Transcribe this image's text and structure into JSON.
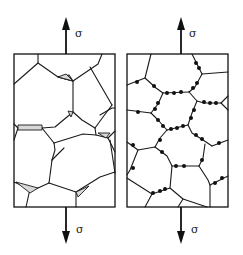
{
  "figure": {
    "panels": [
      {
        "id": "wedge-cracking",
        "stress_label_top": "σ",
        "stress_label_bottom": "σ",
        "feature": "triple-point wedge cracks"
      },
      {
        "id": "cavitation",
        "stress_label_top": "σ",
        "stress_label_bottom": "σ",
        "feature": "grain-boundary cavities"
      }
    ]
  },
  "colors": {
    "line": "#1a1a1a",
    "void_fill": "#d8d8d8",
    "background": "#ffffff"
  }
}
